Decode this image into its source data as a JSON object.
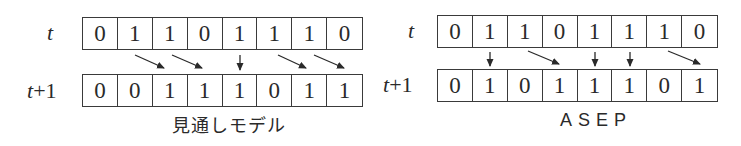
{
  "diagrams": [
    {
      "caption": "見通しモデル",
      "row_labels": {
        "t": "t",
        "t1_var": "t",
        "t1_suffix": "+1"
      },
      "row_t": [
        "0",
        "1",
        "1",
        "0",
        "1",
        "1",
        "1",
        "0"
      ],
      "row_t1": [
        "0",
        "0",
        "1",
        "1",
        "1",
        "0",
        "1",
        "1"
      ],
      "transitions": [
        {
          "from": 1,
          "to": 2,
          "type": "hop"
        },
        {
          "from": 2,
          "to": 3,
          "type": "hop"
        },
        {
          "from": 4,
          "to": 4,
          "type": "stay"
        },
        {
          "from": 5,
          "to": 6,
          "type": "hop"
        },
        {
          "from": 6,
          "to": 7,
          "type": "hop"
        }
      ]
    },
    {
      "caption": "ASEP",
      "row_labels": {
        "t": "t",
        "t1_var": "t",
        "t1_suffix": "+1"
      },
      "row_t": [
        "0",
        "1",
        "1",
        "0",
        "1",
        "1",
        "1",
        "0"
      ],
      "row_t1": [
        "0",
        "1",
        "0",
        "1",
        "1",
        "1",
        "0",
        "1"
      ],
      "transitions": [
        {
          "from": 1,
          "to": 1,
          "type": "stay"
        },
        {
          "from": 2,
          "to": 3,
          "type": "hop"
        },
        {
          "from": 4,
          "to": 4,
          "type": "stay"
        },
        {
          "from": 5,
          "to": 5,
          "type": "stay"
        },
        {
          "from": 6,
          "to": 7,
          "type": "hop"
        }
      ]
    }
  ],
  "colors": {
    "ink": "#2a2a2a",
    "line": "#3a3a3a",
    "background": "#ffffff"
  }
}
